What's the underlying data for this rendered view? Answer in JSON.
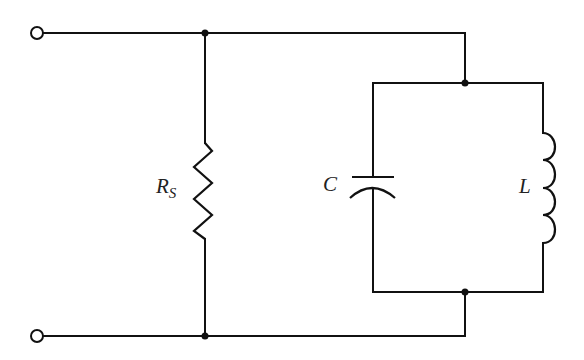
{
  "diagram": {
    "type": "circuit-schematic",
    "colors": {
      "line": "#111111",
      "background": "#ffffff",
      "label": "#222222"
    },
    "terminals": [
      {
        "id": "top-terminal",
        "x": 37,
        "y": 33
      },
      {
        "id": "bottom-terminal",
        "x": 37,
        "y": 336
      }
    ],
    "components": {
      "resistor": {
        "label": "R",
        "subscript": "S",
        "symbol": "zigzag"
      },
      "capacitor": {
        "label": "C",
        "symbol": "flat-and-curved-plate"
      },
      "inductor": {
        "label": "L",
        "symbol": "coil",
        "turns": 4
      }
    },
    "junctions": [
      {
        "x": 205,
        "y": 33
      },
      {
        "x": 205,
        "y": 336
      },
      {
        "x": 465,
        "y": 83
      },
      {
        "x": 465,
        "y": 292
      }
    ]
  }
}
